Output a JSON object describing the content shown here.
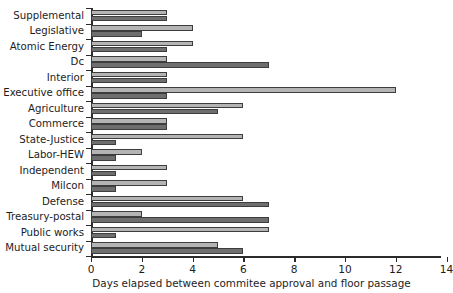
{
  "chart_data": {
    "type": "bar",
    "orientation": "horizontal",
    "title": "",
    "subtitle": "",
    "xlabel": "Days elapsed between commitee approval and floor passage",
    "ylabel": "",
    "xlim": [
      0,
      14
    ],
    "ylim": null,
    "xticks": [
      0,
      2,
      4,
      6,
      8,
      10,
      12,
      14
    ],
    "xticklabels": [
      "0",
      "2",
      "4",
      "6",
      "8",
      "10",
      "12",
      "14"
    ],
    "grid": false,
    "legend": false,
    "legend_position": "none",
    "categories": [
      "Supplemental",
      "Legislative",
      "Atomic Energy",
      "Dc",
      "Interior",
      "Executive office",
      "Agriculture",
      "Commerce",
      "State-Justice",
      "Labor-HEW",
      "Independent",
      "Milcon",
      "Defense",
      "Treasury-postal",
      "Public works",
      "Mutual security"
    ],
    "series": [
      {
        "name": "series-light",
        "color": "#b4b4b4",
        "values": [
          3,
          4,
          4,
          3,
          3,
          12,
          6,
          3,
          6,
          2,
          3,
          3,
          6,
          2,
          7,
          5
        ]
      },
      {
        "name": "series-dark",
        "color": "#6e6e6e",
        "values": [
          3,
          2,
          3,
          7,
          3,
          3,
          5,
          3,
          1,
          1,
          1,
          1,
          7,
          7,
          1,
          6
        ]
      }
    ]
  },
  "axis": {
    "x_title": "Days elapsed between commitee approval and floor passage"
  },
  "colors": {
    "light_bar": "#b4b4b4",
    "dark_bar": "#6e6e6e",
    "bar_border": "#3d3d3d",
    "axis": "#2b2b2b",
    "text": "#1d1d1d",
    "background": "#ffffff"
  }
}
